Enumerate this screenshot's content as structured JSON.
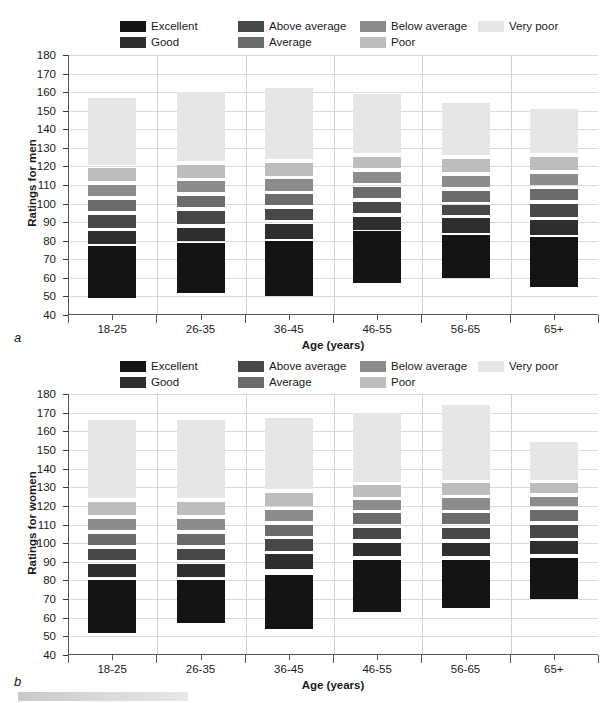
{
  "figure": {
    "panel_a_letter": "a",
    "panel_b_letter": "b"
  },
  "legend": {
    "items": [
      {
        "label": "Excellent",
        "color": "#141414"
      },
      {
        "label": "Good",
        "color": "#2e2e2e"
      },
      {
        "label": "Above average",
        "color": "#484848"
      },
      {
        "label": "Average",
        "color": "#6b6b6b"
      },
      {
        "label": "Below average",
        "color": "#8c8c8c"
      },
      {
        "label": "Poor",
        "color": "#bdbdbd"
      },
      {
        "label": "Very poor",
        "color": "#e6e6e6"
      }
    ]
  },
  "chart_data": [
    {
      "id": "a",
      "type": "bar",
      "subtype": "stacked-floating-bands",
      "title": "",
      "panel_label": "a",
      "xlabel": "Age (years)",
      "ylabel": "Ratings for men",
      "categories": [
        "18-25",
        "26-35",
        "36-45",
        "46-55",
        "56-65",
        "65+"
      ],
      "ylim": [
        40,
        180
      ],
      "yticks": [
        40,
        50,
        60,
        70,
        80,
        90,
        100,
        110,
        120,
        130,
        140,
        150,
        160,
        170,
        180
      ],
      "grid": true,
      "legend_position": "top",
      "series": [
        {
          "name": "Excellent",
          "color": "#141414",
          "ranges": [
            [
              49,
              77
            ],
            [
              52,
              79
            ],
            [
              50,
              80
            ],
            [
              57,
              85
            ],
            [
              60,
              83
            ],
            [
              55,
              82
            ]
          ]
        },
        {
          "name": "Good",
          "color": "#2e2e2e",
          "ranges": [
            [
              78,
              85
            ],
            [
              80,
              87
            ],
            [
              81,
              89
            ],
            [
              86,
              93
            ],
            [
              84,
              92
            ],
            [
              83,
              91
            ]
          ]
        },
        {
          "name": "Above average",
          "color": "#484848",
          "ranges": [
            [
              87,
              94
            ],
            [
              89,
              96
            ],
            [
              91,
              97
            ],
            [
              95,
              101
            ],
            [
              94,
              99
            ],
            [
              93,
              100
            ]
          ]
        },
        {
          "name": "Average",
          "color": "#6b6b6b",
          "ranges": [
            [
              96,
              102
            ],
            [
              98,
              104
            ],
            [
              99,
              105
            ],
            [
              103,
              109
            ],
            [
              101,
              107
            ],
            [
              102,
              108
            ]
          ]
        },
        {
          "name": "Below average",
          "color": "#8c8c8c",
          "ranges": [
            [
              104,
              110
            ],
            [
              106,
              112
            ],
            [
              107,
              113
            ],
            [
              111,
              117
            ],
            [
              109,
              115
            ],
            [
              110,
              116
            ]
          ]
        },
        {
          "name": "Poor",
          "color": "#bdbdbd",
          "ranges": [
            [
              112,
              119
            ],
            [
              114,
              121
            ],
            [
              115,
              122
            ],
            [
              119,
              125
            ],
            [
              117,
              124
            ],
            [
              118,
              125
            ]
          ]
        },
        {
          "name": "Very poor",
          "color": "#e6e6e6",
          "ranges": [
            [
              121,
              157
            ],
            [
              123,
              160
            ],
            [
              124,
              162
            ],
            [
              127,
              159
            ],
            [
              126,
              154
            ],
            [
              127,
              151
            ]
          ]
        }
      ]
    },
    {
      "id": "b",
      "type": "bar",
      "subtype": "stacked-floating-bands",
      "title": "",
      "panel_label": "b",
      "xlabel": "Age (years)",
      "ylabel": "Ratings for women",
      "categories": [
        "18-25",
        "26-35",
        "36-45",
        "46-55",
        "56-65",
        "65+"
      ],
      "ylim": [
        40,
        180
      ],
      "yticks": [
        40,
        50,
        60,
        70,
        80,
        90,
        100,
        110,
        120,
        130,
        140,
        150,
        160,
        170,
        180
      ],
      "grid": true,
      "legend_position": "top",
      "series": [
        {
          "name": "Excellent",
          "color": "#141414",
          "ranges": [
            [
              52,
              80
            ],
            [
              57,
              80
            ],
            [
              54,
              83
            ],
            [
              63,
              91
            ],
            [
              65,
              91
            ],
            [
              70,
              92
            ]
          ]
        },
        {
          "name": "Good",
          "color": "#2e2e2e",
          "ranges": [
            [
              82,
              89
            ],
            [
              82,
              89
            ],
            [
              86,
              94
            ],
            [
              93,
              100
            ],
            [
              93,
              100
            ],
            [
              94,
              101
            ]
          ]
        },
        {
          "name": "Above average",
          "color": "#484848",
          "ranges": [
            [
              91,
              97
            ],
            [
              91,
              97
            ],
            [
              96,
              102
            ],
            [
              102,
              108
            ],
            [
              102,
              108
            ],
            [
              103,
              110
            ]
          ]
        },
        {
          "name": "Average",
          "color": "#6b6b6b",
          "ranges": [
            [
              99,
              105
            ],
            [
              99,
              105
            ],
            [
              104,
              110
            ],
            [
              110,
              116
            ],
            [
              110,
              116
            ],
            [
              112,
              118
            ]
          ]
        },
        {
          "name": "Below average",
          "color": "#8c8c8c",
          "ranges": [
            [
              107,
              113
            ],
            [
              107,
              113
            ],
            [
              112,
              118
            ],
            [
              118,
              123
            ],
            [
              118,
              124
            ],
            [
              120,
              125
            ]
          ]
        },
        {
          "name": "Poor",
          "color": "#bdbdbd",
          "ranges": [
            [
              115,
              122
            ],
            [
              115,
              122
            ],
            [
              120,
              127
            ],
            [
              125,
              131
            ],
            [
              126,
              132
            ],
            [
              127,
              132
            ]
          ]
        },
        {
          "name": "Very poor",
          "color": "#e6e6e6",
          "ranges": [
            [
              124,
              166
            ],
            [
              124,
              166
            ],
            [
              129,
              167
            ],
            [
              133,
              170
            ],
            [
              134,
              174
            ],
            [
              134,
              154
            ]
          ]
        }
      ]
    }
  ]
}
